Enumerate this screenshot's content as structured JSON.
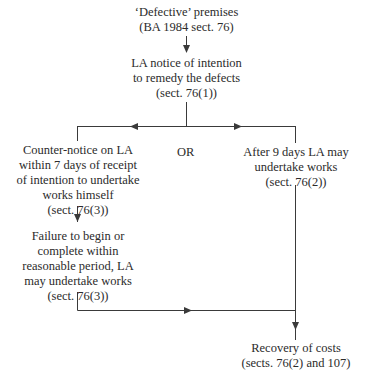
{
  "diagram": {
    "type": "flowchart",
    "nodes": {
      "start": {
        "lines": [
          "‘Defective’ premises",
          "(BA 1984 sect. 76)"
        ]
      },
      "notice": {
        "lines": [
          "LA notice of intention",
          "to remedy the defects",
          "(sect. 76(1))"
        ]
      },
      "counter_notice": {
        "lines": [
          "Counter-notice on LA",
          "within 7 days of receipt",
          "of intention to undertake",
          "works himself",
          "(sect. 76(3))"
        ]
      },
      "after_9_days": {
        "lines": [
          "After 9 days LA may",
          "undertake works",
          "(sect. 76(2))"
        ]
      },
      "failure": {
        "lines": [
          "Failure to begin or",
          "complete within",
          "reasonable period, LA",
          "may undertake works",
          "(sect. 76(3))"
        ]
      },
      "recovery": {
        "lines": [
          "Recovery of costs",
          "(sects. 76(2) and 107)"
        ]
      }
    },
    "branch_label": "OR",
    "edges": [
      {
        "from": "start",
        "to": "notice"
      },
      {
        "from": "notice",
        "to": "counter_notice"
      },
      {
        "from": "notice",
        "to": "after_9_days"
      },
      {
        "from": "counter_notice",
        "to": "failure"
      },
      {
        "from": "failure",
        "to": "recovery"
      },
      {
        "from": "after_9_days",
        "to": "recovery"
      }
    ],
    "line_color": "#3a3a3a"
  }
}
